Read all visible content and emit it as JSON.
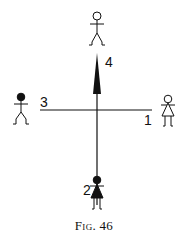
{
  "figure": {
    "caption": "Fig. 46",
    "labels": {
      "right": "1",
      "bottom": "2",
      "left": "3",
      "top": "4"
    },
    "figures": [
      {
        "position": "top",
        "type": "male",
        "head": "open"
      },
      {
        "position": "left",
        "type": "male",
        "head": "filled"
      },
      {
        "position": "right",
        "type": "female",
        "head": "open",
        "dress": "open"
      },
      {
        "position": "bottom",
        "type": "female",
        "head": "filled",
        "dress": "filled"
      }
    ],
    "arrow": {
      "direction": "up",
      "from": "center",
      "toward": "top",
      "label": "4"
    }
  }
}
